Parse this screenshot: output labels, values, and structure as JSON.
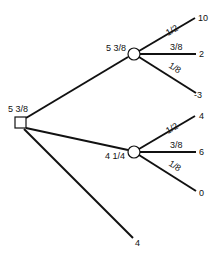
{
  "diagram": {
    "type": "decision-tree",
    "root": {
      "kind": "decision",
      "value": "5 3/8",
      "branches": [
        {
          "kind": "chance",
          "value": "5 3/8",
          "outcomes": [
            {
              "probability": "1/2",
              "payoff": "10"
            },
            {
              "probability": "3/8",
              "payoff": "2"
            },
            {
              "probability": "1/8",
              "payoff": "-3"
            }
          ]
        },
        {
          "kind": "chance",
          "value": "4 1/4",
          "outcomes": [
            {
              "probability": "1/2",
              "payoff": "4"
            },
            {
              "probability": "3/8",
              "payoff": "6"
            },
            {
              "probability": "1/8",
              "payoff": "0"
            }
          ]
        },
        {
          "kind": "terminal",
          "payoff": "4"
        }
      ]
    }
  },
  "colors": {
    "line": "#111111",
    "background": "#ffffff"
  }
}
